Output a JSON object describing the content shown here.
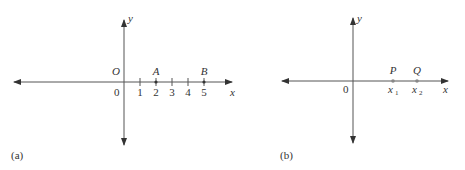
{
  "colors": {
    "ink": "#333333",
    "axis": "#555555",
    "point": "#888888"
  },
  "panel_a": {
    "caption": "(a)",
    "x_axis_label": "x",
    "y_axis_label": "y",
    "origin_label": "O",
    "zero_label": "0",
    "ticks": [
      "1",
      "2",
      "3",
      "4",
      "5"
    ],
    "points": [
      {
        "label": "A",
        "value": "2"
      },
      {
        "label": "B",
        "value": "5"
      }
    ]
  },
  "panel_b": {
    "caption": "(b)",
    "x_axis_label": "x",
    "y_axis_label": "y",
    "zero_label": "0",
    "points": [
      {
        "label": "P",
        "coord": "x",
        "sub": "1"
      },
      {
        "label": "Q",
        "coord": "x",
        "sub": "2"
      }
    ]
  }
}
